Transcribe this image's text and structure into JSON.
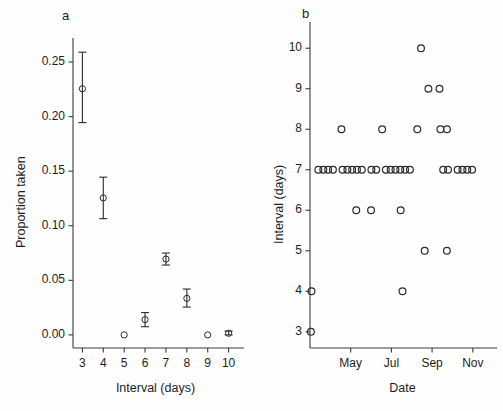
{
  "figure": {
    "background": "#fefefe",
    "axis_color": "#3a3a3a",
    "marker_color": "#2b2b2b",
    "width": 503,
    "height": 411
  },
  "panels": [
    {
      "letter": "a",
      "chart_data": {
        "type": "scatter",
        "title": "",
        "xlabel": "Interval (days)",
        "ylabel": "Proportion taken",
        "xlim": [
          2.55,
          10.45
        ],
        "ylim": [
          -0.012,
          0.272
        ],
        "xticks": [
          3,
          4,
          5,
          6,
          7,
          8,
          9,
          10
        ],
        "xticklabels": [
          "3",
          "4",
          "5",
          "6",
          "7",
          "8",
          "9",
          "10"
        ],
        "yticks": [
          0.0,
          0.05,
          0.1,
          0.15,
          0.2,
          0.25
        ],
        "yticklabels": [
          "0.00",
          "0.05",
          "0.10",
          "0.15",
          "0.20",
          "0.25"
        ],
        "grid": false,
        "legend": "none",
        "marker": "open-circle",
        "errorbars": true,
        "points": [
          {
            "x": 3,
            "y": 0.2255,
            "ylow": 0.1945,
            "yhigh": 0.259
          },
          {
            "x": 4,
            "y": 0.1255,
            "ylow": 0.1065,
            "yhigh": 0.1445
          },
          {
            "x": 5,
            "y": 0.0,
            "ylow": 0.0,
            "yhigh": 0.0
          },
          {
            "x": 6,
            "y": 0.014,
            "ylow": 0.0075,
            "yhigh": 0.0205
          },
          {
            "x": 7,
            "y": 0.0695,
            "ylow": 0.064,
            "yhigh": 0.075
          },
          {
            "x": 8,
            "y": 0.0335,
            "ylow": 0.0255,
            "yhigh": 0.042
          },
          {
            "x": 9,
            "y": 0.0,
            "ylow": 0.0,
            "yhigh": 0.0
          },
          {
            "x": 10,
            "y": 0.0015,
            "ylow": 0.0,
            "yhigh": 0.0035
          }
        ]
      }
    },
    {
      "letter": "b",
      "chart_data": {
        "type": "scatter",
        "title": "",
        "xlabel": "Date",
        "ylabel": "Interval (days)",
        "xlim": [
          0,
          100
        ],
        "ylim": [
          2.6,
          10.45
        ],
        "xticks": [
          22,
          44,
          66,
          88
        ],
        "xticklabels": [
          "May",
          "Jul",
          "Sep",
          "Nov"
        ],
        "yticks": [
          3,
          4,
          5,
          6,
          7,
          8,
          9,
          10
        ],
        "yticklabels": [
          "3",
          "4",
          "5",
          "6",
          "7",
          "8",
          "9",
          "10"
        ],
        "grid": false,
        "legend": "none",
        "marker": "open-circle",
        "errorbars": false,
        "points": [
          {
            "x": 0.5,
            "y": 3
          },
          {
            "x": 0.8,
            "y": 4
          },
          {
            "x": 50.0,
            "y": 4
          },
          {
            "x": 62.0,
            "y": 5
          },
          {
            "x": 74.0,
            "y": 5
          },
          {
            "x": 25.0,
            "y": 6
          },
          {
            "x": 33.0,
            "y": 6
          },
          {
            "x": 49.0,
            "y": 6
          },
          {
            "x": 4.5,
            "y": 7
          },
          {
            "x": 7.2,
            "y": 7
          },
          {
            "x": 9.8,
            "y": 7
          },
          {
            "x": 12.4,
            "y": 7
          },
          {
            "x": 17.6,
            "y": 7
          },
          {
            "x": 20.2,
            "y": 7
          },
          {
            "x": 22.8,
            "y": 7
          },
          {
            "x": 25.4,
            "y": 7
          },
          {
            "x": 28.0,
            "y": 7
          },
          {
            "x": 33.2,
            "y": 7
          },
          {
            "x": 35.8,
            "y": 7
          },
          {
            "x": 41.0,
            "y": 7
          },
          {
            "x": 43.6,
            "y": 7
          },
          {
            "x": 46.2,
            "y": 7
          },
          {
            "x": 48.8,
            "y": 7
          },
          {
            "x": 51.4,
            "y": 7
          },
          {
            "x": 54.0,
            "y": 7
          },
          {
            "x": 72.0,
            "y": 7
          },
          {
            "x": 74.6,
            "y": 7
          },
          {
            "x": 79.8,
            "y": 7
          },
          {
            "x": 82.4,
            "y": 7
          },
          {
            "x": 85.0,
            "y": 7
          },
          {
            "x": 87.6,
            "y": 7
          },
          {
            "x": 17.0,
            "y": 8
          },
          {
            "x": 39.0,
            "y": 8
          },
          {
            "x": 58.0,
            "y": 8
          },
          {
            "x": 70.5,
            "y": 8
          },
          {
            "x": 74.0,
            "y": 8
          },
          {
            "x": 64.0,
            "y": 9
          },
          {
            "x": 70.0,
            "y": 9
          },
          {
            "x": 60.0,
            "y": 10
          }
        ]
      }
    }
  ]
}
